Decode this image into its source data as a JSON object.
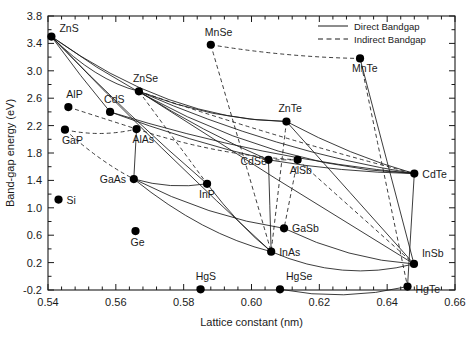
{
  "chart_data": {
    "type": "scatter",
    "title": "",
    "xlabel": "Lattice constant (nm)",
    "ylabel": "Band-gap energy (eV)",
    "xlim": [
      0.54,
      0.66
    ],
    "ylim": [
      -0.2,
      3.8
    ],
    "xticks": [
      "0.54",
      "0.56",
      "0.58",
      "0.60",
      "0.62",
      "0.64",
      "0.66"
    ],
    "xtick_values": [
      0.54,
      0.56,
      0.58,
      0.6,
      0.62,
      0.64,
      0.66
    ],
    "yticks": [
      "-0.2",
      "0.2",
      "0.6",
      "1.0",
      "1.4",
      "1.8",
      "2.2",
      "2.6",
      "3.0",
      "3.4",
      "3.8"
    ],
    "ytick_values": [
      -0.2,
      0.2,
      0.6,
      1.0,
      1.4,
      1.8,
      2.2,
      2.6,
      3.0,
      3.4,
      3.8
    ],
    "grid": false,
    "legend_position": "top-right",
    "legend": [
      {
        "name": "Direct Bandgap",
        "style": "solid"
      },
      {
        "name": "Indirect Bandgap",
        "style": "dashed"
      }
    ],
    "points": [
      {
        "name": "ZnS",
        "x": 0.541,
        "y": 3.5,
        "label_dx": 8,
        "label_dy": -5
      },
      {
        "name": "AlP",
        "x": 0.546,
        "y": 2.47,
        "label_dx": -2,
        "label_dy": -9
      },
      {
        "name": "GaP",
        "x": 0.545,
        "y": 2.14,
        "label_dx": -3,
        "label_dy": 14
      },
      {
        "name": "Si",
        "x": 0.5431,
        "y": 1.12,
        "label_dx": 8,
        "label_dy": 4
      },
      {
        "name": "ZnSe",
        "x": 0.5668,
        "y": 2.7,
        "label_dx": -6,
        "label_dy": -9
      },
      {
        "name": "CdS",
        "x": 0.5583,
        "y": 2.4,
        "label_dx": -6,
        "label_dy": -9
      },
      {
        "name": "AlAs",
        "x": 0.5661,
        "y": 2.15,
        "label_dx": -4,
        "label_dy": 14
      },
      {
        "name": "GaAs",
        "x": 0.5653,
        "y": 1.42,
        "label_dx": -34,
        "label_dy": 4
      },
      {
        "name": "Ge",
        "x": 0.5658,
        "y": 0.66,
        "label_dx": -5,
        "label_dy": 15
      },
      {
        "name": "MnSe",
        "x": 0.588,
        "y": 3.38,
        "label_dx": -6,
        "label_dy": -9
      },
      {
        "name": "HgS",
        "x": 0.585,
        "y": -0.19,
        "label_dx": -5,
        "label_dy": -9
      },
      {
        "name": "InP",
        "x": 0.5869,
        "y": 1.35,
        "label_dx": -8,
        "label_dy": 14
      },
      {
        "name": "ZnTe",
        "x": 0.6103,
        "y": 2.26,
        "label_dx": -8,
        "label_dy": -9
      },
      {
        "name": "CdSe",
        "x": 0.605,
        "y": 1.7,
        "label_dx": -28,
        "label_dy": 5
      },
      {
        "name": "AlSb",
        "x": 0.6136,
        "y": 1.7,
        "label_dx": -8,
        "label_dy": 14
      },
      {
        "name": "GaSb",
        "x": 0.6096,
        "y": 0.7,
        "label_dx": 8,
        "label_dy": 4
      },
      {
        "name": "InAs",
        "x": 0.6058,
        "y": 0.36,
        "label_dx": 8,
        "label_dy": 4
      },
      {
        "name": "HgSe",
        "x": 0.6084,
        "y": -0.19,
        "label_dx": 6,
        "label_dy": -9
      },
      {
        "name": "MnTe",
        "x": 0.632,
        "y": 3.18,
        "label_dx": -8,
        "label_dy": 14
      },
      {
        "name": "CdTe",
        "x": 0.648,
        "y": 1.5,
        "label_dx": 8,
        "label_dy": 4
      },
      {
        "name": "InSb",
        "x": 0.6479,
        "y": 0.18,
        "label_dx": 8,
        "label_dy": -7
      },
      {
        "name": "HgTe",
        "x": 0.646,
        "y": -0.15,
        "label_dx": 8,
        "label_dy": 6
      }
    ],
    "alloy_curves_direct": [
      {
        "from": "ZnS",
        "to": "ZnSe",
        "bow": 0.12
      },
      {
        "from": "ZnS",
        "to": "CdS",
        "bow": 0.02
      },
      {
        "from": "ZnS",
        "to": "ZnTe",
        "bow": 0.3
      },
      {
        "from": "ZnS",
        "to": "CdTe",
        "bow": 0.45
      },
      {
        "from": "ZnS",
        "to": "InP",
        "bow": 0.05
      },
      {
        "from": "ZnS",
        "to": "InAs",
        "bow": 0.05
      },
      {
        "from": "ZnSe",
        "to": "CdSe",
        "bow": 0.05
      },
      {
        "from": "ZnSe",
        "to": "ZnTe",
        "bow": 0.1
      },
      {
        "from": "ZnSe",
        "to": "CdTe",
        "bow": 0.14
      },
      {
        "from": "ZnSe",
        "to": "InSb",
        "bow": 0.02
      },
      {
        "from": "CdS",
        "to": "CdSe",
        "bow": 0.04
      },
      {
        "from": "CdS",
        "to": "CdTe",
        "bow": 0.12
      },
      {
        "from": "ZnTe",
        "to": "CdTe",
        "bow": 0.06
      },
      {
        "from": "CdSe",
        "to": "CdTe",
        "bow": 0.04
      },
      {
        "from": "MnTe",
        "to": "InSb",
        "bow": 0.0
      },
      {
        "from": "GaAs",
        "to": "InAs",
        "bow": 0.14
      },
      {
        "from": "GaAs",
        "to": "GaSb",
        "bow": 0.1
      },
      {
        "from": "GaAs",
        "to": "InP",
        "bow": 0.06
      },
      {
        "from": "InP",
        "to": "InAs",
        "bow": 0.06
      },
      {
        "from": "InAs",
        "to": "InSb",
        "bow": 0.18
      },
      {
        "from": "GaSb",
        "to": "InSb",
        "bow": 0.1
      },
      {
        "from": "HgSe",
        "to": "HgTe",
        "bow": 0.1
      },
      {
        "from": "AlAs",
        "to": "GaAs",
        "bow": 0.0
      },
      {
        "from": "CdSe",
        "to": "InAs",
        "bow": 0.0
      },
      {
        "from": "CdTe",
        "to": "HgTe",
        "bow": 0.0
      },
      {
        "from": "ZnTe",
        "to": "InSb",
        "bow": 0.0
      }
    ],
    "alloy_curves_indirect": [
      {
        "from": "GaP",
        "to": "AlAs",
        "bow": 0.06
      },
      {
        "from": "GaP",
        "to": "GaAs",
        "bow": 0.05
      },
      {
        "from": "AlP",
        "to": "AlAs",
        "bow": 0.0
      },
      {
        "from": "MnSe",
        "to": "MnTe",
        "bow": 0.04
      },
      {
        "from": "MnSe",
        "to": "InAs",
        "bow": 0.0
      },
      {
        "from": "MnTe",
        "to": "HgTe",
        "bow": 0.0
      },
      {
        "from": "ZnSe",
        "to": "InP",
        "bow": 0.0
      },
      {
        "from": "ZnSe",
        "to": "CdTe",
        "bow": 0.04
      },
      {
        "from": "AlAs",
        "to": "AlSb",
        "bow": 0.08
      },
      {
        "from": "CdSe",
        "to": "AlSb",
        "bow": 0.0
      },
      {
        "from": "ZnTe",
        "to": "InAs",
        "bow": 0.0
      },
      {
        "from": "AlSb",
        "to": "GaSb",
        "bow": 0.0
      },
      {
        "from": "AlSb",
        "to": "InSb",
        "bow": 0.0
      }
    ]
  },
  "colors": {
    "line": "#1a1a1a",
    "marker": "#000000",
    "text": "#1a1a1a",
    "background": "#ffffff"
  }
}
